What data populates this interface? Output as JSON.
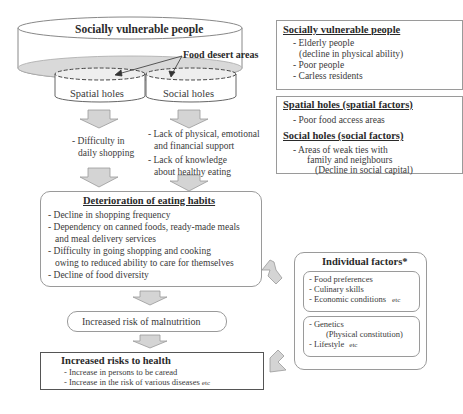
{
  "diagram": {
    "top_cylinder": {
      "title": "Socially vulnerable people",
      "food_desert_label": "Food desert areas",
      "spatial_holes": "Spatial holes",
      "social_holes": "Social holes"
    },
    "spatial_effects": [
      "- Difficulty in",
      "daily shopping"
    ],
    "social_effects": [
      "- Lack of physical, emotional",
      "and financial support",
      "- Lack of  knowledge",
      "about healthy eating"
    ],
    "deterioration_box": {
      "title": "Deterioration of eating habits",
      "items": [
        "- Decline in shopping frequency",
        "- Dependency on canned foods, ready-made meals",
        "and meal delivery services",
        "- Difficulty in going shopping and cooking",
        "owing to reduced ability to care for themselves",
        "- Decline of food diversity"
      ]
    },
    "malnutrition_box": {
      "label": "Increased risk of malnutrition"
    },
    "health_box": {
      "title": "Increased risks to health",
      "items": [
        "- Increase in persons to be caread",
        "- Increase in the risk of various diseases"
      ],
      "etc": "etc"
    },
    "legend": {
      "vulnerable": {
        "title": "Socially vulnerable people",
        "items": [
          "- Elderly people",
          "(decline in physical ability)",
          "- Poor people",
          "- Carless residents"
        ]
      },
      "spatial": {
        "title": "Spatial holes (spatial factors)",
        "items": [
          "- Poor food access areas"
        ]
      },
      "social": {
        "title": "Social holes (social factors)",
        "items": [
          "- Areas of weak ties with",
          "family and neighbours",
          "(Decline in social capital)"
        ]
      }
    },
    "individual_factors": {
      "title": "Individual factors*",
      "group1": [
        "- Food preferences",
        "- Culinary skills",
        "- Economic conditions"
      ],
      "group1_etc": "etc",
      "group2": [
        "- Genetics",
        "(Physical constitution)",
        "- Lifestyle"
      ],
      "group2_etc": "etc"
    }
  }
}
